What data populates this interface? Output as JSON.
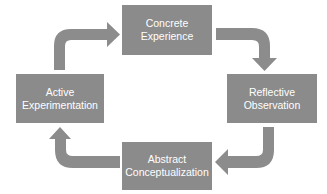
{
  "diagram": {
    "type": "cycle",
    "colors": {
      "box_fill": "#8b8b8b",
      "arrow_fill": "#8c8c8c",
      "text": "#ffffff",
      "background": "#ffffff"
    },
    "nodes": [
      {
        "id": "concrete",
        "line1": "Concrete",
        "line2": "Experience"
      },
      {
        "id": "reflective",
        "line1": "Reflective",
        "line2": "Observation"
      },
      {
        "id": "abstract",
        "line1": "Abstract",
        "line2": "Conceptualization"
      },
      {
        "id": "active",
        "line1": "Active",
        "line2": "Experimentation"
      }
    ],
    "edges": [
      {
        "from": "Concrete Experience",
        "to": "Reflective Observation"
      },
      {
        "from": "Reflective Observation",
        "to": "Abstract Conceptualization"
      },
      {
        "from": "Abstract Conceptualization",
        "to": "Active Experimentation"
      },
      {
        "from": "Active Experimentation",
        "to": "Concrete Experience"
      }
    ]
  }
}
